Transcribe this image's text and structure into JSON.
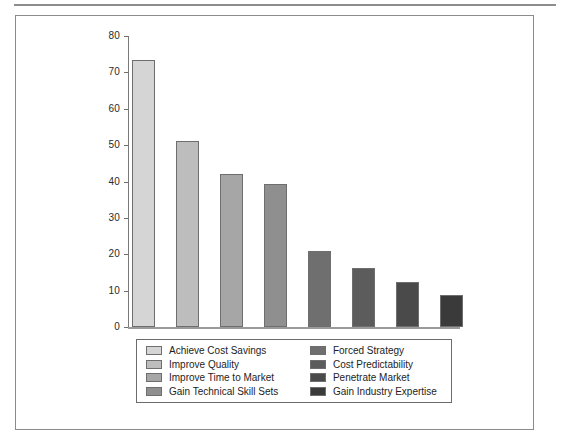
{
  "chart_data": {
    "type": "bar",
    "title": "",
    "subtitle": "",
    "xlabel": "",
    "ylabel": "",
    "ylim": [
      0,
      80
    ],
    "grid": false,
    "legend_position": "bottom",
    "ytick_labels": [
      "80",
      "70",
      "60",
      "50",
      "40",
      "30",
      "20",
      "10",
      "0"
    ],
    "ytick_values": [
      80,
      70,
      60,
      50,
      40,
      30,
      20,
      10,
      0
    ],
    "categories": [
      "Achieve Cost Savings",
      "Improve Quality",
      "Improve Time to Market",
      "Gain Technical Skill Sets",
      "Forced Strategy",
      "Cost Predictability",
      "Penetrate Market",
      "Gain Industry Expertise"
    ],
    "values": [
      73.4,
      51.0,
      42.0,
      39.4,
      20.9,
      16.2,
      12.4,
      8.8
    ],
    "colors": [
      "#d5d5d5",
      "#bdbdbd",
      "#a6a6a6",
      "#8f8f8f",
      "#6f6f6f",
      "#5c5c5c",
      "#4a4a4a",
      "#3a3a3a"
    ]
  },
  "legend": {
    "left_column": [
      {
        "label": "Achieve Cost Savings",
        "color": "#d5d5d5"
      },
      {
        "label": "Improve Quality",
        "color": "#bdbdbd"
      },
      {
        "label": "Improve Time to Market",
        "color": "#a6a6a6"
      },
      {
        "label": "Gain Technical Skill Sets",
        "color": "#8f8f8f"
      }
    ],
    "right_column": [
      {
        "label": "Forced Strategy",
        "color": "#6f6f6f"
      },
      {
        "label": "Cost Predictability",
        "color": "#5c5c5c"
      },
      {
        "label": "Penetrate Market",
        "color": "#4a4a4a"
      },
      {
        "label": "Gain Industry Expertise",
        "color": "#3a3a3a"
      }
    ]
  },
  "axis": {
    "baseline_value": "0",
    "top_value": "80"
  }
}
